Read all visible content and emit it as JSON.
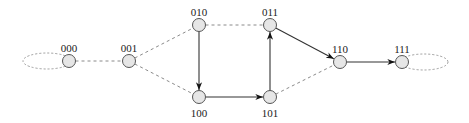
{
  "diagram": {
    "type": "state-transition-graph",
    "nodes": [
      {
        "id": "000",
        "label": "000",
        "label_pos": "above"
      },
      {
        "id": "001",
        "label": "001",
        "label_pos": "above"
      },
      {
        "id": "010",
        "label": "010",
        "label_pos": "above"
      },
      {
        "id": "011",
        "label": "011",
        "label_pos": "above"
      },
      {
        "id": "100",
        "label": "100",
        "label_pos": "below"
      },
      {
        "id": "101",
        "label": "101",
        "label_pos": "below"
      },
      {
        "id": "110",
        "label": "110",
        "label_pos": "above"
      },
      {
        "id": "111",
        "label": "111",
        "label_pos": "above"
      }
    ],
    "edges": [
      {
        "from": "000",
        "to": "000",
        "style": "dashed",
        "directed": false,
        "self_loop": true
      },
      {
        "from": "000",
        "to": "001",
        "style": "dashed",
        "directed": false
      },
      {
        "from": "001",
        "to": "010",
        "style": "dashed",
        "directed": false
      },
      {
        "from": "001",
        "to": "100",
        "style": "dashed",
        "directed": false
      },
      {
        "from": "010",
        "to": "011",
        "style": "dashed",
        "directed": false
      },
      {
        "from": "010",
        "to": "100",
        "style": "solid",
        "directed": true
      },
      {
        "from": "100",
        "to": "101",
        "style": "solid",
        "directed": true
      },
      {
        "from": "101",
        "to": "011",
        "style": "solid",
        "directed": true
      },
      {
        "from": "011",
        "to": "110",
        "style": "solid",
        "directed": true
      },
      {
        "from": "101",
        "to": "110",
        "style": "dashed",
        "directed": false
      },
      {
        "from": "110",
        "to": "111",
        "style": "solid",
        "directed": true
      },
      {
        "from": "111",
        "to": "111",
        "style": "dashed",
        "directed": false,
        "self_loop": true
      }
    ],
    "colors": {
      "node_fill": "#e6e6e6",
      "node_stroke": "#555555",
      "solid_edge": "#333333",
      "dashed_edge": "#8a8a8a"
    }
  }
}
